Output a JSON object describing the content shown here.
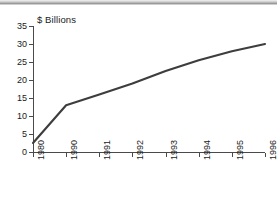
{
  "chart_data": {
    "type": "line",
    "title": "",
    "ylabel": "$ Billions",
    "xlabel": "",
    "categories": [
      "1980",
      "1990",
      "1991",
      "1992",
      "1993",
      "1994",
      "1995",
      "1996"
    ],
    "values": [
      2.5,
      13,
      16,
      19,
      22.5,
      25.5,
      28,
      30
    ],
    "series": [
      {
        "name": "",
        "values": [
          2.5,
          13,
          16,
          19,
          22.5,
          25.5,
          28,
          30
        ]
      }
    ],
    "yticks": [
      0,
      5,
      10,
      15,
      20,
      25,
      30,
      35
    ],
    "ytick_labels": [
      "0",
      "5",
      "10",
      "15",
      "20",
      "25",
      "30",
      "35"
    ],
    "ylim": [
      0,
      35
    ],
    "grid": false,
    "legend": false,
    "line_color": "#3d3d3d"
  },
  "axis": {
    "y_title": "$ Billions"
  }
}
